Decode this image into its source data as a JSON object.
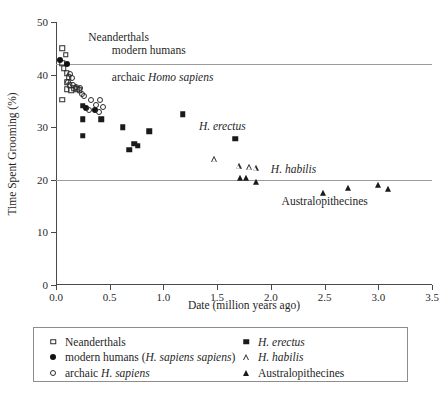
{
  "chart_data": {
    "type": "scatter",
    "title": "",
    "xlabel": "Date (million years ago)",
    "ylabel": "Time Spent Grooming (%)",
    "xlim": [
      0.0,
      3.5
    ],
    "ylim": [
      0,
      50
    ],
    "xticks": [
      "0.0",
      "0.5",
      "1.0",
      "1.5",
      "2.0",
      "2.5",
      "3.0",
      "3.5"
    ],
    "xtick_values": [
      0.0,
      0.5,
      1.0,
      1.5,
      2.0,
      2.5,
      3.0,
      3.5
    ],
    "yticks": [
      "0",
      "10",
      "20",
      "30",
      "40",
      "50"
    ],
    "ytick_values": [
      0,
      10,
      20,
      30,
      40,
      50
    ],
    "grid": "horizontal gridlines at y = 20 and y = 42",
    "gridlines_y": [
      20,
      42
    ],
    "legend_position": "below plot, boxed, two columns",
    "series": [
      {
        "name": "Neanderthals",
        "marker": "open-square",
        "color": "#2b2b2b",
        "points": [
          [
            0.06,
            45.0
          ],
          [
            0.09,
            43.8
          ],
          [
            0.06,
            42.2
          ],
          [
            0.07,
            41.2
          ],
          [
            0.1,
            40.3
          ],
          [
            0.12,
            39.5
          ],
          [
            0.1,
            38.5
          ],
          [
            0.13,
            38.0
          ],
          [
            0.1,
            37.2
          ],
          [
            0.14,
            37.0
          ],
          [
            0.17,
            37.4
          ],
          [
            0.2,
            37.2
          ],
          [
            0.06,
            35.2
          ],
          [
            0.22,
            37.0
          ]
        ]
      },
      {
        "name": "modern humans (H. sapiens sapiens)",
        "marker": "filled-circle",
        "color": "#111111",
        "points": [
          [
            0.04,
            42.8
          ],
          [
            0.1,
            42.0
          ],
          [
            0.28,
            33.7
          ],
          [
            0.36,
            33.3
          ]
        ]
      },
      {
        "name": "archaic H. sapiens",
        "marker": "open-circle",
        "color": "#2b2b2b",
        "points": [
          [
            0.13,
            40.1
          ],
          [
            0.15,
            39.3
          ],
          [
            0.11,
            38.6
          ],
          [
            0.16,
            38.1
          ],
          [
            0.19,
            37.6
          ],
          [
            0.22,
            37.4
          ],
          [
            0.24,
            36.4
          ],
          [
            0.26,
            35.9
          ],
          [
            0.33,
            35.2
          ],
          [
            0.41,
            35.2
          ],
          [
            0.37,
            34.2
          ],
          [
            0.44,
            33.8
          ],
          [
            0.31,
            33.3
          ],
          [
            0.4,
            32.9
          ]
        ]
      },
      {
        "name": "H. erectus",
        "marker": "filled-square",
        "color": "#1a1a1a",
        "points": [
          [
            0.25,
            34.1
          ],
          [
            0.25,
            31.5
          ],
          [
            0.25,
            28.4
          ],
          [
            0.42,
            31.5
          ],
          [
            0.62,
            30.0
          ],
          [
            0.68,
            25.7
          ],
          [
            0.73,
            26.9
          ],
          [
            0.76,
            26.5
          ],
          [
            0.87,
            29.2
          ],
          [
            1.18,
            32.5
          ],
          [
            1.67,
            27.8
          ]
        ]
      },
      {
        "name": "H. habilis",
        "marker": "open-triangle",
        "color": "#2b2b2b",
        "points": [
          [
            1.47,
            23.9
          ],
          [
            1.7,
            22.6
          ],
          [
            1.8,
            22.4
          ],
          [
            1.86,
            22.2
          ]
        ]
      },
      {
        "name": "Australopithecines",
        "marker": "filled-triangle",
        "color": "#1a1a1a",
        "points": [
          [
            1.71,
            20.3
          ],
          [
            1.77,
            20.4
          ],
          [
            1.86,
            19.6
          ],
          [
            2.49,
            17.5
          ],
          [
            2.72,
            18.5
          ],
          [
            3.0,
            19.0
          ],
          [
            3.09,
            18.2
          ]
        ]
      }
    ],
    "annotations": [
      {
        "text": "Neanderthals",
        "x": 0.3,
        "y": 47.0,
        "italic": false
      },
      {
        "text": "modern humans",
        "x": 0.52,
        "y": 44.5,
        "italic": false
      },
      {
        "text_parts": [
          "archaic ",
          "Homo sapiens"
        ],
        "x": 0.52,
        "y": 39.3
      },
      {
        "text": "H. erectus",
        "x": 1.33,
        "y": 30.0,
        "italic": true
      },
      {
        "text": "H. habilis",
        "x": 2.0,
        "y": 21.8,
        "italic": true
      },
      {
        "text": "Australopithecines",
        "x": 2.1,
        "y": 15.8,
        "italic": false
      }
    ]
  },
  "annotations": {
    "neanderthals": "Neanderthals",
    "modern_humans": "modern humans",
    "archaic_prefix": "archaic ",
    "archaic_italic": "Homo sapiens",
    "h_erectus": "H. erectus",
    "h_habilis": "H. habilis",
    "australopithecines": "Australopithecines"
  },
  "axes": {
    "x_title": "Date (million years ago)",
    "y_title": "Time Spent Grooming (%)"
  },
  "legend": {
    "left_column": [
      {
        "label": "Neanderthals",
        "marker": "open-square",
        "italic_part": ""
      },
      {
        "label_prefix": "modern humans (",
        "label_italic": "H. sapiens sapiens",
        "label_suffix": ")",
        "marker": "filled-circle"
      },
      {
        "label_prefix": "archaic ",
        "label_italic": "H. sapiens",
        "label_suffix": "",
        "marker": "open-circle"
      }
    ],
    "right_column": [
      {
        "label_italic": "H. erectus",
        "marker": "filled-square"
      },
      {
        "label_italic": "H. habilis",
        "marker": "open-triangle"
      },
      {
        "label": "Australopithecines",
        "marker": "filled-triangle"
      }
    ]
  }
}
